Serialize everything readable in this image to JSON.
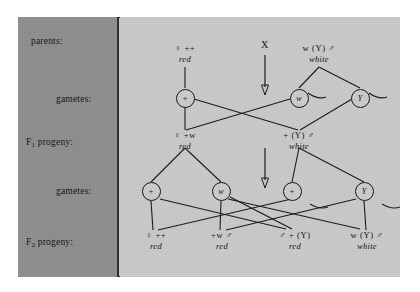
{
  "figure": {
    "colors": {
      "page_background": "#ffffff",
      "label_panel": "#8e8e8e",
      "diagram_panel": "#c9c9c9",
      "ink": "#18181a"
    }
  },
  "row_labels": [
    {
      "id": "parents",
      "text": "parents:"
    },
    {
      "id": "gametes1",
      "text": "gametes:"
    },
    {
      "id": "f1",
      "prefix": "F",
      "sub": "1",
      "suffix": " progeny:"
    },
    {
      "id": "gametes2",
      "text": "gametes:"
    },
    {
      "id": "f2",
      "prefix": "F",
      "sub": "2",
      "suffix": " progeny:"
    }
  ],
  "cross_symbol": "X",
  "parents": [
    {
      "id": "mother",
      "genotype": "♀ ++",
      "phenotype": "red"
    },
    {
      "id": "father",
      "genotype": "w (Y) ♂",
      "phenotype": "white"
    }
  ],
  "gametes_row1": [
    {
      "id": "egg-plus",
      "allele": "+"
    },
    {
      "id": "sperm-w",
      "allele": "w"
    },
    {
      "id": "sperm-y",
      "allele": "Y"
    }
  ],
  "f1_progeny": [
    {
      "id": "f1-female",
      "genotype": "♀ +w",
      "phenotype": "red"
    },
    {
      "id": "f1-male",
      "genotype": "+ (Y) ♂",
      "phenotype": "white"
    }
  ],
  "gametes_row2": [
    {
      "id": "f1-egg-plus",
      "allele": "+"
    },
    {
      "id": "f1-egg-w",
      "allele": "w"
    },
    {
      "id": "f1-sperm-plus",
      "allele": "+"
    },
    {
      "id": "f1-sperm-y",
      "allele": "Y"
    }
  ],
  "f2_progeny": [
    {
      "id": "f2-1",
      "genotype": "♀ ++",
      "phenotype": "red"
    },
    {
      "id": "f2-2",
      "genotype": "+w ♂",
      "phenotype": "red"
    },
    {
      "id": "f2-3",
      "genotype": "♂ + (Y)",
      "phenotype": "red"
    },
    {
      "id": "f2-4",
      "genotype": "w (Y) ♂",
      "phenotype": "white"
    }
  ]
}
